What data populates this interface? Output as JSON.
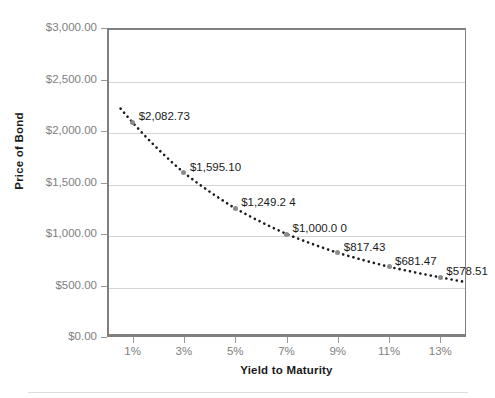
{
  "chart_data": {
    "type": "scatter",
    "title": "",
    "xlabel": "Yield to Maturity",
    "ylabel": "Price of Bond",
    "x": [
      1,
      3,
      5,
      7,
      9,
      11,
      13
    ],
    "categories": [
      "1%",
      "3%",
      "5%",
      "7%",
      "9%",
      "11%",
      "13%"
    ],
    "values": [
      2082.73,
      1595.1,
      1249.24,
      1000.0,
      817.43,
      681.47,
      578.51
    ],
    "point_labels": [
      "$2,082.73",
      "$1,595.10",
      "$1,249.2 4",
      "$1,000.0 0",
      "$817.43",
      "$681.47",
      "$578.51"
    ],
    "xlim": [
      0,
      14
    ],
    "ylim": [
      0,
      3000
    ],
    "ytick_labels": [
      "$3,000.00",
      "$2,500.00",
      "$2,000.00",
      "$1,500.00",
      "$1,000.00",
      "$500.00",
      "$0.00"
    ],
    "ytick_values": [
      3000,
      2500,
      2000,
      1500,
      1000,
      500,
      0
    ],
    "xtick_labels": [
      "1%",
      "3%",
      "5%",
      "7%",
      "9%",
      "11%",
      "13%"
    ],
    "grid": true,
    "legend": false,
    "series_style": {
      "line": "dotted",
      "line_color": "#1a1a1a",
      "marker": "circle",
      "marker_color": "#8c8c8c"
    },
    "colors": {
      "gridline": "#d4d4d4",
      "axis": "#808080",
      "tick_text": "#808080",
      "title_text": "#1a1a1a",
      "background": "#ffffff"
    }
  }
}
